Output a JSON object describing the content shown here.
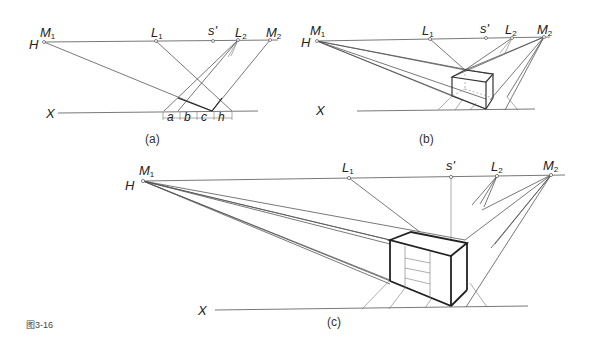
{
  "figure_label": "图3-16",
  "panels": {
    "a": {
      "caption": "(a)",
      "labels": {
        "H": "H",
        "M1": "M",
        "M1_sub": "1",
        "L1": "L",
        "L1_sub": "1",
        "s": "s'",
        "L2": "L",
        "L2_sub": "2",
        "M2": "M",
        "M2_sub": "2",
        "X": "X"
      },
      "measure_labels": [
        "a",
        "b",
        "c",
        "h"
      ]
    },
    "b": {
      "caption": "(b)",
      "labels": {
        "H": "H",
        "M1": "M",
        "M1_sub": "1",
        "L1": "L",
        "L1_sub": "1",
        "s": "s'",
        "L2": "L",
        "L2_sub": "2",
        "M2": "M",
        "M2_sub": "2",
        "X": "X"
      }
    },
    "c": {
      "caption": "(c)",
      "labels": {
        "H": "H",
        "M1": "M",
        "M1_sub": "1",
        "L1": "L",
        "L1_sub": "1",
        "s": "s'",
        "L2": "L",
        "L2_sub": "2",
        "M2": "M",
        "M2_sub": "2",
        "X": "X"
      }
    }
  }
}
